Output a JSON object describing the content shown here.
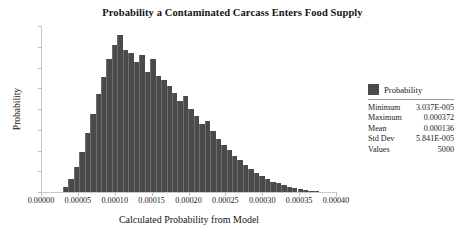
{
  "chart_data": {
    "type": "bar",
    "title": "Probability a Contaminated Carcass Enters Food Supply",
    "xlabel": "Calculated Probability from Model",
    "ylabel": "Probability",
    "grid": false,
    "legend_position": "right",
    "xlim": [
      0.0,
      0.0004
    ],
    "xtick_labels": [
      "0.00000",
      "0.00005",
      "0.00010",
      "0.00015",
      "0.00020",
      "0.00025",
      "0.00030",
      "0.00035",
      "0.00040"
    ],
    "xtick_values": [
      0.0,
      5e-05,
      0.0001,
      0.00015,
      0.0002,
      0.00025,
      0.0003,
      0.00035,
      0.0004
    ],
    "ytick_labels": [],
    "ytick_count": 9,
    "bin_width": 7.4e-06,
    "bin_starts": [
      2.96e-05,
      3.7e-05,
      4.44e-05,
      5.18e-05,
      5.92e-05,
      6.66e-05,
      7.4e-05,
      8.14e-05,
      8.88e-05,
      9.62e-05,
      0.0001036,
      0.000111,
      0.0001184,
      0.0001258,
      0.0001332,
      0.0001406,
      0.000148,
      0.0001554,
      0.0001628,
      0.0001702,
      0.0001776,
      0.000185,
      0.0001924,
      0.0001998,
      0.0002072,
      0.0002146,
      0.000222,
      0.0002294,
      0.0002368,
      0.0002442,
      0.0002516,
      0.000259,
      0.0002664,
      0.0002738,
      0.0002812,
      0.0002886,
      0.000296,
      0.0003034,
      0.0003108,
      0.0003182,
      0.0003256,
      0.000333,
      0.0003404,
      0.0003478,
      0.0003552,
      0.0003626,
      0.00037
    ],
    "values": [
      5,
      14,
      26,
      42,
      62,
      82,
      103,
      121,
      140,
      155,
      166,
      150,
      147,
      137,
      144,
      126,
      140,
      122,
      118,
      112,
      104,
      96,
      101,
      88,
      80,
      72,
      75,
      64,
      56,
      50,
      44,
      38,
      34,
      28,
      24,
      20,
      17,
      14,
      11,
      9,
      7,
      5,
      4,
      3,
      2,
      1,
      1
    ],
    "ymax": 175,
    "series": [
      {
        "name": "Probability",
        "color": "#4a4a4a"
      }
    ],
    "stats": {
      "header": "Probability",
      "rows": [
        {
          "label": "Minimum",
          "value": "3.037E-005"
        },
        {
          "label": "Maximum",
          "value": "0.000372"
        },
        {
          "label": "Mean",
          "value": "0.000136"
        },
        {
          "label": "Std Dev",
          "value": "5.841E-005"
        },
        {
          "label": "Values",
          "value": "5000"
        }
      ]
    }
  }
}
